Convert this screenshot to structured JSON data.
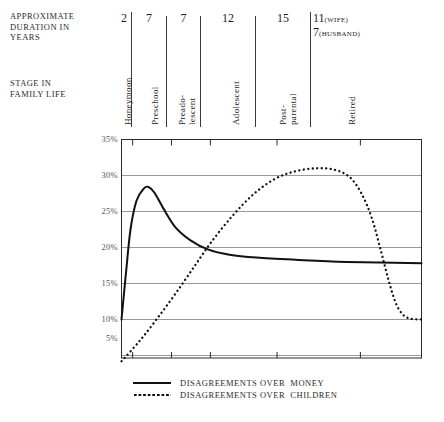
{
  "header": {
    "duration_label": "APPROXIMATE\nDURATION IN\nYEARS",
    "stage_label": "STAGE IN\nFAMILY LIFE",
    "durations": [
      {
        "value": "2",
        "note": ""
      },
      {
        "value": "7",
        "note": ""
      },
      {
        "value": "7",
        "note": ""
      },
      {
        "value": "12",
        "note": ""
      },
      {
        "value": "15",
        "note": ""
      },
      {
        "value": "11",
        "note": "(WIFE)"
      },
      {
        "value": "7",
        "note": "(HUSBAND)"
      }
    ],
    "stages": [
      "Honeymoon",
      "Preschool",
      "Preado-\nlescent",
      "Adolescent",
      "Post-\nparental",
      "Retired"
    ]
  },
  "legend": {
    "items": [
      {
        "label": "DISAGREEMENTS OVER  MONEY",
        "style": "solid"
      },
      {
        "label": "DISAGREEMENTS OVER  CHILDREN",
        "style": "dotted"
      }
    ]
  },
  "axis": {
    "y_ticks": [
      "35%",
      "30%",
      "25%",
      "20%",
      "15%",
      "10%",
      "5%"
    ]
  },
  "colors": {
    "line": "#111111",
    "grid": "#8d8d8d",
    "frame": "#2a2a2a",
    "text": "#2b2b2b"
  },
  "chart_data": {
    "type": "line",
    "title": "",
    "xlabel": "STAGE IN FAMILY LIFE",
    "ylabel": "",
    "ylim": [
      4,
      35
    ],
    "ytick_values": [
      35,
      30,
      25,
      20,
      15,
      10,
      5
    ],
    "grid": true,
    "legend_position": "bottom",
    "x_categories": [
      "Honeymoon",
      "Preschool",
      "Preadolescent",
      "Adolescent",
      "Post-parental",
      "Retired"
    ],
    "x_durations_years": [
      2,
      7,
      7,
      12,
      15,
      11
    ],
    "series": [
      {
        "name": "DISAGREEMENTS OVER MONEY",
        "style": "solid",
        "points": [
          {
            "x": 0.0,
            "y": 10.0
          },
          {
            "x": 1.5,
            "y": 16.5
          },
          {
            "x": 3.0,
            "y": 22.5
          },
          {
            "x": 5.0,
            "y": 26.5
          },
          {
            "x": 7.5,
            "y": 28.2
          },
          {
            "x": 9.0,
            "y": 28.4
          },
          {
            "x": 11.0,
            "y": 27.6
          },
          {
            "x": 14.0,
            "y": 25.4
          },
          {
            "x": 18.0,
            "y": 22.8
          },
          {
            "x": 23.0,
            "y": 21.0
          },
          {
            "x": 29.0,
            "y": 19.7
          },
          {
            "x": 36.0,
            "y": 19.0
          },
          {
            "x": 45.0,
            "y": 18.6
          },
          {
            "x": 58.0,
            "y": 18.3
          },
          {
            "x": 75.0,
            "y": 18.0
          },
          {
            "x": 100.0,
            "y": 17.8
          }
        ]
      },
      {
        "name": "DISAGREEMENTS OVER CHILDREN",
        "style": "dotted",
        "points": [
          {
            "x": 0.0,
            "y": 4.2
          },
          {
            "x": 6.0,
            "y": 7.0
          },
          {
            "x": 12.0,
            "y": 10.2
          },
          {
            "x": 18.0,
            "y": 13.6
          },
          {
            "x": 24.0,
            "y": 17.2
          },
          {
            "x": 30.0,
            "y": 20.8
          },
          {
            "x": 37.0,
            "y": 24.4
          },
          {
            "x": 44.0,
            "y": 27.4
          },
          {
            "x": 51.0,
            "y": 29.5
          },
          {
            "x": 58.0,
            "y": 30.6
          },
          {
            "x": 65.0,
            "y": 31.0
          },
          {
            "x": 71.0,
            "y": 30.8
          },
          {
            "x": 76.0,
            "y": 29.8
          },
          {
            "x": 80.0,
            "y": 27.5
          },
          {
            "x": 83.5,
            "y": 24.0
          },
          {
            "x": 86.5,
            "y": 19.5
          },
          {
            "x": 89.0,
            "y": 15.5
          },
          {
            "x": 91.5,
            "y": 12.2
          },
          {
            "x": 94.0,
            "y": 10.6
          },
          {
            "x": 96.5,
            "y": 10.1
          },
          {
            "x": 100.0,
            "y": 10.0
          }
        ]
      }
    ]
  }
}
